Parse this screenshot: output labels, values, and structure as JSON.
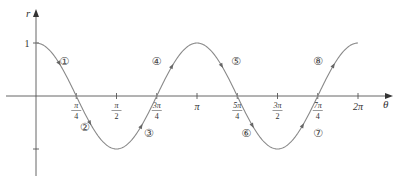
{
  "chart_data": {
    "type": "line",
    "title": "",
    "xlabel": "θ",
    "ylabel": "r",
    "function": "r = cos 2θ",
    "xlim": [
      0,
      6.2832
    ],
    "ylim": [
      -1,
      1
    ],
    "grid": false,
    "legend": null,
    "x_ticks": [
      {
        "value": 0.7854,
        "num": "π",
        "den": "4"
      },
      {
        "value": 1.5708,
        "num": "π",
        "den": "2"
      },
      {
        "value": 2.3562,
        "num": "3π",
        "den": "4"
      },
      {
        "value": 3.1416,
        "num": "π",
        "den": ""
      },
      {
        "value": 3.927,
        "num": "5π",
        "den": "4"
      },
      {
        "value": 4.7124,
        "num": "3π",
        "den": "2"
      },
      {
        "value": 5.4978,
        "num": "7π",
        "den": "4"
      },
      {
        "value": 6.2832,
        "num": "2π",
        "den": ""
      }
    ],
    "y_ticks": [
      {
        "value": 1,
        "label": "1"
      },
      {
        "value": -1,
        "label": ""
      }
    ],
    "series": [
      {
        "name": "cos 2θ",
        "x": [
          0,
          0.3927,
          0.7854,
          1.1781,
          1.5708,
          1.9635,
          2.3562,
          2.7489,
          3.1416,
          3.5343,
          3.927,
          4.3197,
          4.7124,
          5.1051,
          5.4978,
          5.8905,
          6.2832
        ],
        "y": [
          1,
          0.7071,
          0,
          -0.7071,
          -1,
          -0.7071,
          0,
          0.7071,
          1,
          0.7071,
          0,
          -0.7071,
          -1,
          -0.7071,
          0,
          0.7071,
          1
        ]
      }
    ],
    "annotations": [
      {
        "text": "①",
        "theta": 0.55,
        "r": 0.66
      },
      {
        "text": "②",
        "theta": 0.95,
        "r": -0.58
      },
      {
        "text": "③",
        "theta": 2.2,
        "r": -0.7
      },
      {
        "text": "④",
        "theta": 2.35,
        "r": 0.66
      },
      {
        "text": "⑤",
        "theta": 3.9,
        "r": 0.66
      },
      {
        "text": "⑥",
        "theta": 4.1,
        "r": -0.7
      },
      {
        "text": "⑦",
        "theta": 5.5,
        "r": -0.7
      },
      {
        "text": "⑧",
        "theta": 5.5,
        "r": 0.66
      }
    ],
    "direction_arrows": [
      0.45,
      1.05,
      2.05,
      2.65,
      3.62,
      4.22,
      5.2,
      5.8
    ]
  }
}
